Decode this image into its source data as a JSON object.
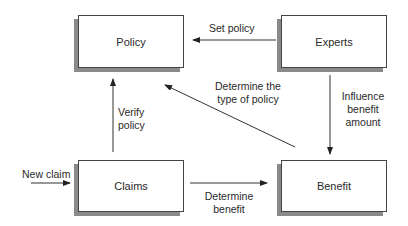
{
  "diagram": {
    "type": "flow-diagram",
    "nodes": [
      {
        "id": "policy",
        "label": "Policy"
      },
      {
        "id": "experts",
        "label": "Experts"
      },
      {
        "id": "claims",
        "label": "Claims"
      },
      {
        "id": "benefit",
        "label": "Benefit"
      }
    ],
    "edges": [
      {
        "from": "experts",
        "to": "policy",
        "label": "Set policy"
      },
      {
        "from": "claims",
        "to": "policy",
        "label_lines": [
          "Verify",
          "policy"
        ]
      },
      {
        "from": "benefit",
        "to": "policy",
        "label_lines": [
          "Determine the",
          "type of policy"
        ]
      },
      {
        "from": "experts",
        "to": "benefit",
        "label_lines": [
          "Influence",
          "benefit",
          "amount"
        ]
      },
      {
        "from": "external",
        "to": "claims",
        "label": "New claim"
      },
      {
        "from": "claims",
        "to": "benefit",
        "label_lines": [
          "Determine",
          "benefit"
        ]
      }
    ],
    "colors": {
      "line": "#333333",
      "box_border": "#444444",
      "shadow": "#8a8a8a",
      "text": "#2a2a2a"
    }
  }
}
